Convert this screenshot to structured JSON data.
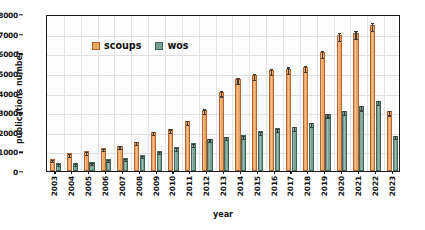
{
  "chart_data": {
    "type": "bar",
    "title": "",
    "xlabel": "year",
    "ylabel": "publications number",
    "ylim": [
      0,
      8000
    ],
    "ytick_values": [
      0,
      1000,
      2000,
      3000,
      4000,
      5000,
      6000,
      7000,
      8000
    ],
    "ytick_labels": [
      "0",
      "1000",
      "2000",
      "3000",
      "4000",
      "5000",
      "6000",
      "7000",
      "8000"
    ],
    "grid": true,
    "legend_position": "upper-left-inside",
    "categories": [
      "2003",
      "2004",
      "2005",
      "2006",
      "2007",
      "2008",
      "2009",
      "2010",
      "2011",
      "2012",
      "2013",
      "2014",
      "2015",
      "2016",
      "2017",
      "2018",
      "2019",
      "2020",
      "2021",
      "2022",
      "2023"
    ],
    "series": [
      {
        "name": "scoups",
        "color": "#eaa664",
        "edge_color": "#b5622c",
        "values": [
          620,
          900,
          1000,
          1180,
          1300,
          1490,
          2010,
          2130,
          2530,
          3130,
          4040,
          4700,
          4900,
          5140,
          5220,
          5310,
          6050,
          6920,
          7050,
          7440,
          3050
        ],
        "errors": [
          55,
          60,
          60,
          60,
          60,
          70,
          80,
          90,
          100,
          110,
          140,
          160,
          150,
          160,
          160,
          160,
          170,
          200,
          200,
          210,
          120
        ]
      },
      {
        "name": "wos",
        "color": "#77a192",
        "edge_color": "#3f6458",
        "values": [
          420,
          400,
          450,
          610,
          680,
          830,
          1020,
          1210,
          1410,
          1640,
          1740,
          1830,
          2020,
          2170,
          2240,
          2440,
          2930,
          3070,
          3290,
          3560,
          1800
        ],
        "errors": [
          45,
          45,
          45,
          50,
          50,
          55,
          60,
          65,
          70,
          75,
          75,
          80,
          85,
          85,
          85,
          90,
          100,
          100,
          105,
          110,
          80
        ]
      }
    ]
  },
  "legend": {
    "items": [
      {
        "label": "scoups",
        "series": "scoups"
      },
      {
        "label": "wos",
        "series": "wos"
      }
    ]
  }
}
